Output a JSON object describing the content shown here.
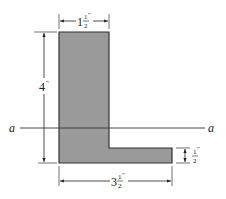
{
  "diagram": {
    "type": "L-shaped cross-section",
    "fill_color": "#9a9a9a",
    "stroke_color": "#333333",
    "dimensions": {
      "top_width": {
        "whole": "1",
        "num": "1",
        "den": "2",
        "unit": "″"
      },
      "height": {
        "whole": "4",
        "unit": "″"
      },
      "bottom_width": {
        "whole": "3",
        "num": "1",
        "den": "2",
        "unit": "″"
      },
      "flange_thickness": {
        "num": "1",
        "den": "2",
        "unit": "″"
      }
    },
    "axis": {
      "left_label": "a",
      "right_label": "a"
    }
  }
}
